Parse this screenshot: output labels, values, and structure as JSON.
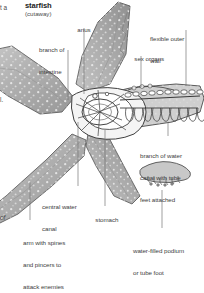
{
  "figure": {
    "title": "starfish",
    "subtitle": "(cutaway)",
    "type": "anatomical-diagram",
    "subject": "starfish",
    "view": "cutaway",
    "colors": {
      "background": "#ffffff",
      "body_fill": "#b9b9b9",
      "body_shade": "#8f8f8f",
      "outline": "#4a4a4a",
      "organ_outline": "#3c3c3c",
      "label_text": "#3d3d3d",
      "title_text": "#1b1b1b",
      "leader_line": "#6f6f6f"
    }
  },
  "labels": [
    {
      "id": "anus",
      "text": "anus"
    },
    {
      "id": "branch-of-intestine",
      "line1": "branch of",
      "line2": "intestine"
    },
    {
      "id": "flexible-outer-wall",
      "line1": "flexible outer",
      "line2": "wall"
    },
    {
      "id": "sex-organs",
      "text": "sex organs"
    },
    {
      "id": "branch-of-water-canal",
      "line1": "branch of water",
      "line2": "canal with tube",
      "line3": "feet attached"
    },
    {
      "id": "central-water-canal",
      "line1": "central water",
      "line2": "canal"
    },
    {
      "id": "stomach",
      "text": "stomach"
    },
    {
      "id": "arm-with-spines",
      "line1": "arm with spines",
      "line2": "and pincers to",
      "line3": "attack enemies"
    },
    {
      "id": "water-filled-podium",
      "line1": "water-filled podium",
      "line2": "or tube foot"
    }
  ],
  "cropped_text": {
    "top_left": "t a",
    "mid_left": "l.",
    "bottom_left": "of"
  }
}
